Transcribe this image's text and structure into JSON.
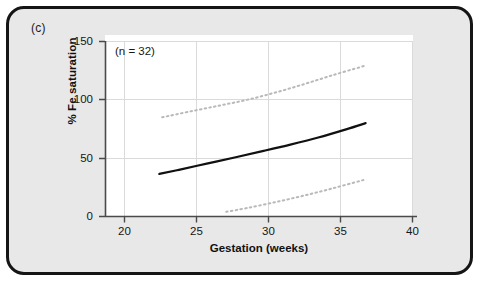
{
  "figure": {
    "panel_label": "(c)",
    "background_color": "#e8e8e8",
    "frame_color": "#151515",
    "plot_background": "#ffffff"
  },
  "chart_data": {
    "type": "line",
    "title": "",
    "subtitle": "",
    "panel": "(c)",
    "xlabel": "Gestation (weeks)",
    "ylabel": "% Fe saturation",
    "xlim": [
      18.7,
      40.8
    ],
    "ylim": [
      0,
      150
    ],
    "xticks": [
      20,
      25,
      30,
      35,
      40
    ],
    "xtick_labels": [
      "20",
      "25",
      "30",
      "35",
      "40"
    ],
    "yticks": [
      0,
      50,
      100,
      150
    ],
    "ytick_labels": [
      "0",
      "50",
      "100",
      "150"
    ],
    "grid": true,
    "grid_color": "#d8d8d8",
    "legend": null,
    "annotations": [
      {
        "name": "sample-size",
        "text": "(n = 32)",
        "x": 20.1,
        "y": 142
      }
    ],
    "series": [
      {
        "name": "Fitted mean % Fe saturation",
        "style": "solid",
        "color": "#111111",
        "width": 2.2,
        "x": [
          22.6,
          24.0,
          26.0,
          28.0,
          30.0,
          32.0,
          34.0,
          36.0,
          37.4
        ],
        "values": [
          36.5,
          40.0,
          45.3,
          50.6,
          56.0,
          61.6,
          67.7,
          74.7,
          80.0
        ]
      },
      {
        "name": "Upper 95% reference limit",
        "style": "dotted",
        "color": "#b9b9b9",
        "width": 2.0,
        "x": [
          22.8,
          25.0,
          27.0,
          29.0,
          31.0,
          33.0,
          35.0,
          37.0,
          37.4
        ],
        "values": [
          85.0,
          90.5,
          95.3,
          100.3,
          106.5,
          113.5,
          121.0,
          128.0,
          129.5
        ]
      },
      {
        "name": "Lower 95% reference limit",
        "style": "dotted",
        "color": "#b9b9b9",
        "width": 2.0,
        "x": [
          27.4,
          29.0,
          31.0,
          33.0,
          35.0,
          37.0,
          37.4
        ],
        "values": [
          4.0,
          7.5,
          12.5,
          18.0,
          24.0,
          30.5,
          32.0
        ]
      }
    ]
  },
  "axis": {
    "y_title": "% Fe saturation",
    "x_title": "Gestation (weeks)",
    "ytick_0": "0",
    "ytick_1": "50",
    "ytick_2": "100",
    "ytick_3": "150",
    "xtick_0": "20",
    "xtick_1": "25",
    "xtick_2": "30",
    "xtick_3": "35",
    "xtick_4": "40"
  }
}
